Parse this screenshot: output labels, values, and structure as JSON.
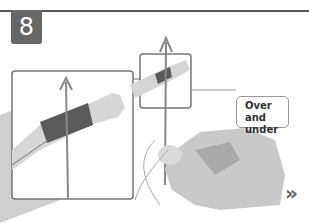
{
  "step": {
    "number": "8"
  },
  "callout": {
    "text": "Over and under"
  },
  "nav": {
    "next_icon": "»"
  },
  "colors": {
    "badge": "#666666",
    "rule": "#555555",
    "arrow": "#777777",
    "thread": "#555555"
  }
}
